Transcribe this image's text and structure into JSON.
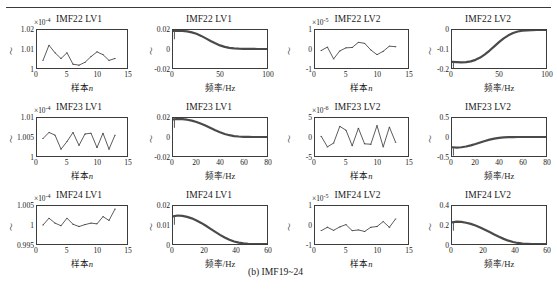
{
  "figure": {
    "caption": "(b) IMF19~24",
    "xlabel_time": "样本n",
    "xlabel_freq": "频率/Hz",
    "ylabel": "～"
  },
  "chart_data": [
    {
      "id": "imf22-lv1-time",
      "type": "line",
      "title": "IMF22 LV1",
      "exponent": "×10",
      "exponent_sup": "-4",
      "xlabel": "样本n",
      "ylabel": "～",
      "xlim": [
        0,
        15
      ],
      "ylim": [
        1,
        1.02
      ],
      "xticks": [
        "0",
        "5",
        "10",
        "15"
      ],
      "yticks": [
        "1",
        "1.01",
        "1.02"
      ],
      "x": [
        1,
        2,
        3,
        4,
        5,
        6,
        7,
        8,
        9,
        10,
        11,
        12,
        13
      ],
      "values": [
        1.004,
        1.012,
        1.008,
        1.005,
        1.008,
        1.002,
        1.0015,
        1.003,
        1.006,
        1.0085,
        1.007,
        1.004,
        1.005
      ],
      "grid": false
    },
    {
      "id": "imf22-lv1-freq",
      "type": "line",
      "title": "IMF22 LV1",
      "exponent": "",
      "exponent_sup": "",
      "xlabel": "频率/Hz",
      "ylabel": "～",
      "xlim": [
        0,
        100
      ],
      "ylim": [
        -0.02,
        0.02
      ],
      "xticks": [
        "0",
        "50",
        "100"
      ],
      "yticks": [
        "-0.02",
        "0",
        "0.02"
      ],
      "x": [
        0,
        5,
        10,
        15,
        20,
        25,
        30,
        35,
        40,
        45,
        50,
        55,
        60,
        65,
        70,
        75,
        80,
        85,
        90,
        95,
        100
      ],
      "values": [
        0.019,
        0.0192,
        0.019,
        0.0185,
        0.0175,
        0.016,
        0.0138,
        0.0112,
        0.0085,
        0.006,
        0.0038,
        0.0022,
        0.0012,
        0.0006,
        0.0003,
        0.0002,
        0.0001,
        0.0001,
        0.0,
        0.0,
        0.0
      ],
      "grid": false
    },
    {
      "id": "imf22-lv2-time",
      "type": "line",
      "title": "IMF22 LV2",
      "exponent": "×10",
      "exponent_sup": "-5",
      "xlabel": "样本n",
      "ylabel": "～",
      "xlim": [
        0,
        15
      ],
      "ylim": [
        -1,
        1
      ],
      "xticks": [
        "0",
        "5",
        "10",
        "15"
      ],
      "yticks": [
        "-1",
        "0",
        "1"
      ],
      "x": [
        1,
        2,
        3,
        4,
        5,
        6,
        7,
        8,
        9,
        10,
        11,
        12,
        13
      ],
      "values": [
        -0.08,
        0.1,
        -0.52,
        -0.1,
        0.06,
        0.08,
        0.35,
        0.3,
        -0.05,
        -0.3,
        -0.12,
        0.15,
        0.12
      ],
      "grid": false
    },
    {
      "id": "imf22-lv2-freq",
      "type": "line",
      "title": "IMF22 LV2",
      "exponent": "",
      "exponent_sup": "",
      "xlabel": "频率/Hz",
      "ylabel": "～",
      "xlim": [
        0,
        100
      ],
      "ylim": [
        -0.2,
        0
      ],
      "xticks": [
        "0",
        "50",
        "100"
      ],
      "yticks": [
        "-0.2",
        "-0.1",
        "0"
      ],
      "x": [
        0,
        5,
        10,
        15,
        20,
        25,
        30,
        35,
        40,
        45,
        50,
        55,
        60,
        65,
        70,
        75,
        80,
        85,
        90,
        95,
        100
      ],
      "values": [
        -0.168,
        -0.169,
        -0.17,
        -0.169,
        -0.165,
        -0.157,
        -0.145,
        -0.128,
        -0.108,
        -0.086,
        -0.064,
        -0.044,
        -0.028,
        -0.016,
        -0.008,
        -0.004,
        -0.002,
        -0.001,
        0.0,
        0.0,
        0.0
      ],
      "grid": false
    },
    {
      "id": "imf23-lv1-time",
      "type": "line",
      "title": "IMF23 LV1",
      "exponent": "×10",
      "exponent_sup": "-4",
      "xlabel": "样本n",
      "ylabel": "～",
      "xlim": [
        0,
        15
      ],
      "ylim": [
        1,
        1.01
      ],
      "xticks": [
        "0",
        "5",
        "10",
        "15"
      ],
      "yticks": [
        "1",
        "1.005",
        "1.01"
      ],
      "x": [
        1,
        2,
        3,
        4,
        5,
        6,
        7,
        8,
        9,
        10,
        11,
        12,
        13
      ],
      "values": [
        1.0046,
        1.0062,
        1.0055,
        1.0018,
        1.0038,
        1.0062,
        1.0028,
        1.0058,
        1.006,
        1.0022,
        1.006,
        1.0018,
        1.0055
      ],
      "grid": false
    },
    {
      "id": "imf23-lv1-freq",
      "type": "line",
      "title": "IMF23 LV1",
      "exponent": "",
      "exponent_sup": "",
      "xlabel": "频率/Hz",
      "ylabel": "～",
      "xlim": [
        0,
        80
      ],
      "ylim": [
        -0.02,
        0.02
      ],
      "xticks": [
        "0",
        "20",
        "40",
        "60",
        "80"
      ],
      "yticks": [
        "-0.02",
        "0",
        "0.02"
      ],
      "x": [
        0,
        4,
        8,
        12,
        16,
        20,
        24,
        28,
        32,
        36,
        40,
        44,
        48,
        52,
        56,
        60,
        64,
        68,
        72,
        76,
        80
      ],
      "values": [
        0.0185,
        0.019,
        0.0188,
        0.0182,
        0.0172,
        0.0158,
        0.014,
        0.0118,
        0.0094,
        0.007,
        0.005,
        0.0032,
        0.0019,
        0.001,
        0.0005,
        0.0002,
        0.0001,
        0.0,
        0.0,
        0.0,
        0.0
      ],
      "grid": false
    },
    {
      "id": "imf23-lv2-time",
      "type": "line",
      "title": "IMF23 LV2",
      "exponent": "×10",
      "exponent_sup": "-6",
      "xlabel": "样本n",
      "ylabel": "～",
      "xlim": [
        0,
        15
      ],
      "ylim": [
        -5,
        5
      ],
      "xticks": [
        "0",
        "5",
        "10",
        "15"
      ],
      "yticks": [
        "-5",
        "0",
        "5"
      ],
      "x": [
        1,
        2,
        3,
        4,
        5,
        6,
        7,
        8,
        9,
        10,
        11,
        12,
        13
      ],
      "values": [
        0.2,
        -2.6,
        -1.6,
        2.8,
        1.8,
        -2.3,
        2.3,
        -1.8,
        -1.9,
        3.0,
        -2.6,
        2.6,
        -1.4
      ],
      "grid": false
    },
    {
      "id": "imf23-lv2-freq",
      "type": "line",
      "title": "IMF23 LV2",
      "exponent": "",
      "exponent_sup": "",
      "xlabel": "频率/Hz",
      "ylabel": "～",
      "xlim": [
        0,
        80
      ],
      "ylim": [
        -0.5,
        0.5
      ],
      "xticks": [
        "0",
        "20",
        "40",
        "60",
        "80"
      ],
      "yticks": [
        "-0.5",
        "0",
        "0.5"
      ],
      "x": [
        0,
        4,
        8,
        12,
        16,
        20,
        24,
        28,
        32,
        36,
        40,
        44,
        48,
        52,
        56,
        60,
        64,
        68,
        72,
        76,
        80
      ],
      "values": [
        -0.27,
        -0.28,
        -0.27,
        -0.25,
        -0.22,
        -0.185,
        -0.145,
        -0.105,
        -0.07,
        -0.042,
        -0.022,
        -0.01,
        -0.004,
        -0.001,
        0.0,
        0.0,
        0.0,
        0.0,
        0.0,
        0.0,
        0.0
      ],
      "grid": false
    },
    {
      "id": "imf24-lv1-time",
      "type": "line",
      "title": "IMF24 LV1",
      "exponent": "×10",
      "exponent_sup": "-4",
      "xlabel": "样本n",
      "ylabel": "～",
      "xlim": [
        0,
        15
      ],
      "ylim": [
        0.995,
        1.005
      ],
      "xticks": [
        "0",
        "5",
        "10",
        "15"
      ],
      "yticks": [
        "0.995",
        "1",
        "1.005"
      ],
      "x": [
        1,
        2,
        3,
        4,
        5,
        6,
        7,
        8,
        9,
        10,
        11,
        12,
        13
      ],
      "values": [
        1.0,
        1.0018,
        1.0005,
        0.9998,
        1.0018,
        1.0002,
        0.9996,
        1.0001,
        1.0005,
        1.0003,
        1.0022,
        1.0012,
        1.0042
      ],
      "grid": false
    },
    {
      "id": "imf24-lv1-freq",
      "type": "line",
      "title": "IMF24 LV1",
      "exponent": "",
      "exponent_sup": "",
      "xlabel": "频率/Hz",
      "ylabel": "～",
      "xlim": [
        0,
        60
      ],
      "ylim": [
        0,
        0.02
      ],
      "xticks": [
        "0",
        "20",
        "40",
        "60"
      ],
      "yticks": [
        "0",
        "0.01",
        "0.02"
      ],
      "x": [
        0,
        3,
        6,
        9,
        12,
        15,
        18,
        21,
        24,
        27,
        30,
        33,
        36,
        39,
        42,
        45,
        48,
        51,
        54,
        57,
        60
      ],
      "values": [
        0.0145,
        0.015,
        0.0148,
        0.0143,
        0.0135,
        0.0124,
        0.0111,
        0.0096,
        0.008,
        0.0064,
        0.0048,
        0.0034,
        0.0022,
        0.0013,
        0.0007,
        0.0003,
        0.0001,
        0.0,
        0.0,
        0.0,
        0.0
      ],
      "grid": false
    },
    {
      "id": "imf24-lv2-time",
      "type": "line",
      "title": "IMF24 LV2",
      "exponent": "×10",
      "exponent_sup": "-5",
      "xlabel": "样本n",
      "ylabel": "～",
      "xlim": [
        0,
        15
      ],
      "ylim": [
        -1,
        1
      ],
      "xticks": [
        "0",
        "5",
        "10",
        "15"
      ],
      "yticks": [
        "-1",
        "0",
        "1"
      ],
      "x": [
        1,
        2,
        3,
        4,
        5,
        6,
        7,
        8,
        9,
        10,
        11,
        12,
        13
      ],
      "values": [
        -0.3,
        -0.12,
        -0.28,
        -0.1,
        0.02,
        -0.3,
        -0.26,
        -0.34,
        -0.12,
        -0.08,
        0.18,
        -0.12,
        0.32
      ],
      "grid": false
    },
    {
      "id": "imf24-lv2-freq",
      "type": "line",
      "title": "IMF24 LV2",
      "exponent": "",
      "exponent_sup": "",
      "xlabel": "频率/Hz",
      "ylabel": "～",
      "xlim": [
        0,
        60
      ],
      "ylim": [
        0,
        0.4
      ],
      "xticks": [
        "0",
        "20",
        "40",
        "60"
      ],
      "yticks": [
        "0",
        "0.2",
        "0.4"
      ],
      "x": [
        0,
        3,
        6,
        9,
        12,
        15,
        18,
        21,
        24,
        27,
        30,
        33,
        36,
        39,
        42,
        45,
        48,
        51,
        54,
        57,
        60
      ],
      "values": [
        0.228,
        0.235,
        0.232,
        0.224,
        0.212,
        0.195,
        0.174,
        0.151,
        0.126,
        0.1,
        0.076,
        0.054,
        0.035,
        0.021,
        0.011,
        0.005,
        0.002,
        0.0,
        0.0,
        0.0,
        0.0
      ],
      "grid": false
    }
  ]
}
